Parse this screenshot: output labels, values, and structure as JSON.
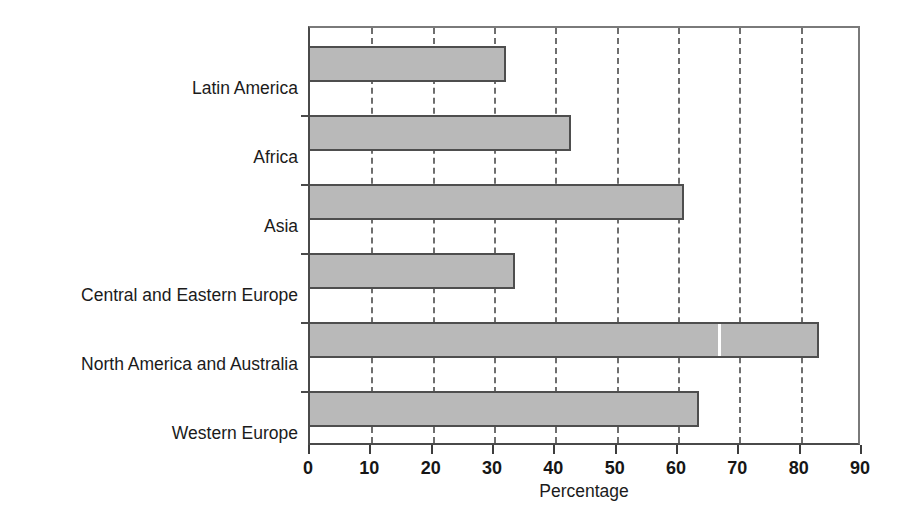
{
  "chart_data": {
    "type": "bar",
    "orientation": "horizontal",
    "title": "",
    "xlabel": "Percentage",
    "ylabel": "",
    "xlim": [
      0,
      90
    ],
    "xticks": [
      0,
      10,
      20,
      30,
      40,
      50,
      60,
      70,
      80,
      90
    ],
    "grid": true,
    "grid_axis": "x",
    "grid_style": "dashed",
    "legend": null,
    "categories": [
      "Latin America",
      "Africa",
      "Asia",
      "Central and Eastern Europe",
      "North America and Australia",
      "Western Europe"
    ],
    "values": [
      32,
      42.5,
      61,
      33.5,
      83,
      63.5
    ],
    "colors": {
      "bar_fill": "#b9b9b9",
      "bar_border": "#4e4e4e",
      "axis": "#4a4a4a",
      "grid": "#6e6e6e",
      "text": "#1b1b1b",
      "background": "#ffffff"
    }
  },
  "axis": {
    "x_title": "Percentage",
    "tick_labels": [
      "0",
      "10",
      "20",
      "30",
      "40",
      "50",
      "60",
      "70",
      "80",
      "90"
    ]
  }
}
